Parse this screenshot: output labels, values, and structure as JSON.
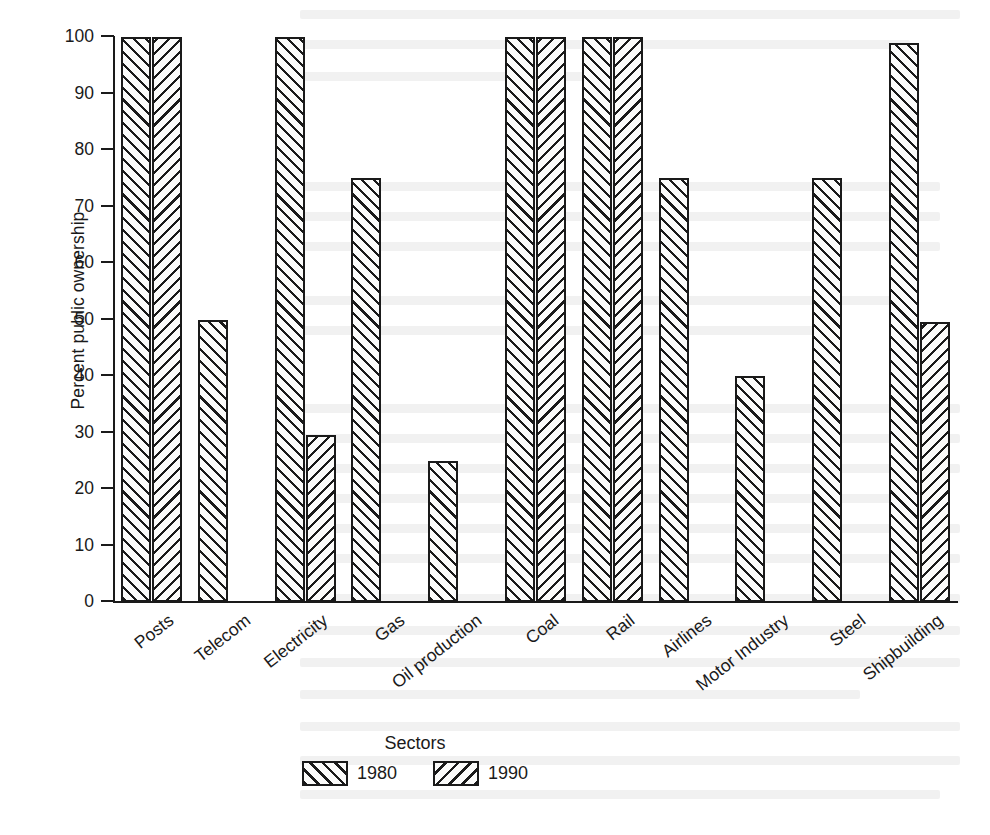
{
  "chart_data": {
    "type": "bar",
    "title": "",
    "xlabel": "Sectors",
    "ylabel": "Percent public ownership",
    "ylim": [
      0,
      100
    ],
    "ytick_step": 10,
    "yticks": [
      0,
      10,
      20,
      30,
      40,
      50,
      60,
      70,
      80,
      90,
      100
    ],
    "grid": false,
    "legend_position": "bottom-center",
    "categories": [
      "Posts",
      "Telecom",
      "Electricity",
      "Gas",
      "Oil production",
      "Coal",
      "Rail",
      "Airlines",
      "Motor Industry",
      "Steel",
      "Shipbuilding"
    ],
    "series": [
      {
        "name": "1980",
        "hatch": "forward-diagonal",
        "values": [
          100,
          50,
          100,
          75,
          25,
          100,
          100,
          75,
          40,
          75,
          99
        ]
      },
      {
        "name": "1990",
        "hatch": "backward-diagonal",
        "values": [
          100,
          null,
          29.5,
          null,
          null,
          100,
          100,
          null,
          null,
          null,
          49.5
        ]
      }
    ]
  },
  "axes": {
    "y_title": "Percent public ownership",
    "x_title": "Sectors",
    "y_tick_labels": [
      "100",
      "90",
      "80",
      "70",
      "60",
      "50",
      "40",
      "30",
      "20",
      "10",
      "0"
    ]
  },
  "legend": {
    "entries": [
      {
        "label": "1980",
        "swatch": "forward-diagonal-hatch-swatch"
      },
      {
        "label": "1990",
        "swatch": "backward-diagonal-hatch-swatch"
      }
    ]
  },
  "colors": {
    "ink": "#1a1a1a",
    "paper": "#ffffff",
    "bar_fill": "#fbfbfa"
  }
}
